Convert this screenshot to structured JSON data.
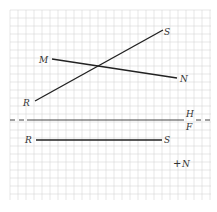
{
  "diagram": {
    "type": "descriptive-geometry-projection",
    "grid": {
      "x0": 10,
      "y0": 10,
      "x1": 211,
      "y1": 200,
      "cell": 8,
      "color": "#d6d6d6"
    },
    "top_view": {
      "line_RS": {
        "from": "R",
        "to": "S",
        "label_R": "R",
        "label_S": "S"
      },
      "line_MN": {
        "from": "M",
        "to": "N",
        "label_M": "M",
        "label_N": "N"
      }
    },
    "folding_line": {
      "upper_label": "H",
      "lower_label": "F"
    },
    "front_view": {
      "line_RS": {
        "label_R": "R",
        "label_S": "S"
      },
      "point_N": {
        "label": "N",
        "marker": "+"
      }
    }
  }
}
